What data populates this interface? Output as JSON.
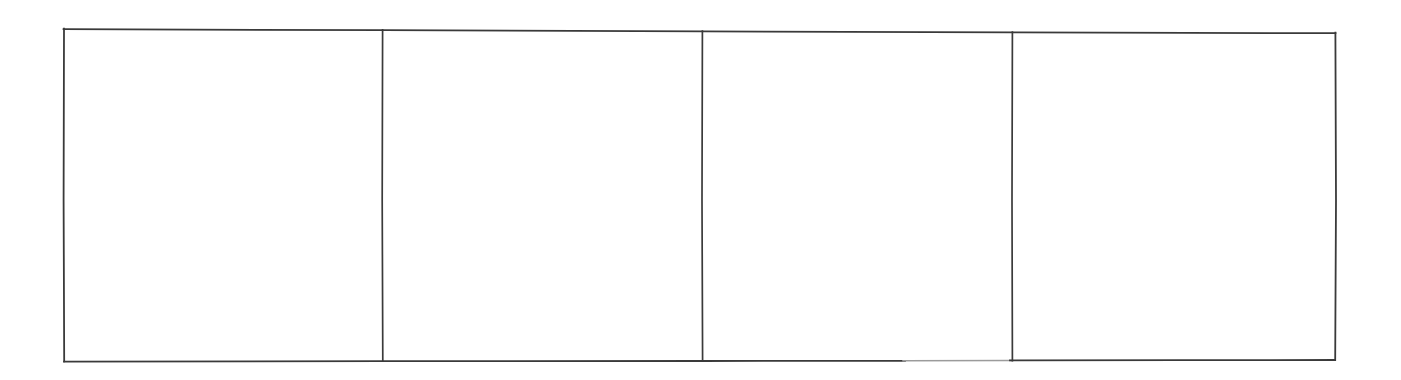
{
  "document": {
    "kind": "blank-table-frame",
    "background_color": "#ffffff",
    "line_color": "#3a3a3a",
    "line_color_faded": "#9b9b9b",
    "line_width_px": 1.6,
    "canvas": {
      "width": 1401,
      "height": 380
    }
  },
  "table": {
    "name": "blank-four-column-table",
    "rows": 1,
    "columns": 4,
    "has_header_row": false,
    "has_visible_text": false,
    "outer_frame": {
      "left_x": 63,
      "right_x": 1336,
      "top_y_left": 28,
      "top_y_right": 33,
      "bottom_y_left": 361,
      "bottom_y_right": 360
    },
    "column_dividers_x": [
      382,
      702,
      1012
    ],
    "column_widths_px": [
      319,
      320,
      310,
      324
    ],
    "cells": [
      {
        "index": 0,
        "row": 0,
        "column": 0,
        "text": "",
        "empty": true
      },
      {
        "index": 1,
        "row": 0,
        "column": 1,
        "text": "",
        "empty": true
      },
      {
        "index": 2,
        "row": 0,
        "column": 2,
        "text": "",
        "empty": true
      },
      {
        "index": 3,
        "row": 0,
        "column": 3,
        "text": "",
        "empty": true
      }
    ]
  }
}
